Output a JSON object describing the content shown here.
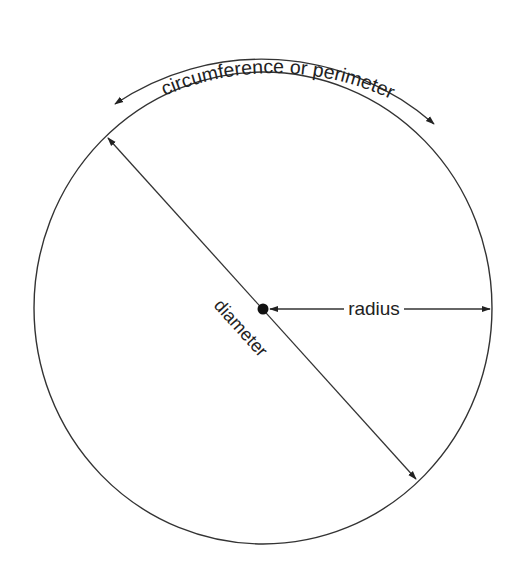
{
  "diagram": {
    "labels": {
      "circumference": "circumference or perimeter",
      "diameter": "diameter",
      "radius": "radius"
    },
    "elements": [
      "circle",
      "center-point",
      "radius-arrow",
      "diameter-arrow",
      "circumference-arc-arrow"
    ],
    "colors": {
      "stroke": "#333333",
      "background": "#ffffff"
    }
  }
}
